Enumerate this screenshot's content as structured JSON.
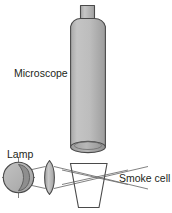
{
  "figure": {
    "background_color": "#ffffff",
    "outline_color": "#3a3a3a",
    "ray_color": "#5a5a5a",
    "body_fill": "#b3b3b3",
    "body_fill_light": "#c9c9c9",
    "body_fill_dark": "#9a9a9a",
    "text_color": "#231f20",
    "width": 172,
    "height": 213
  },
  "labels": {
    "microscope": "Microscope",
    "lamp": "Lamp",
    "smoke_cell": "Smoke cell"
  },
  "parts": {
    "microscope": {
      "name": "microscope",
      "eyepiece_label": "eyepiece tube",
      "barrel_label": "microscope barrel",
      "objective_label": "objective opening"
    },
    "lamp": {
      "name": "lamp",
      "bulb_label": "lamp bulb",
      "filament_label": "lamp filament"
    },
    "lens": {
      "name": "converging lens"
    },
    "smoke_cell": {
      "name": "smoke cell"
    },
    "light_rays": {
      "name": "light rays"
    }
  }
}
